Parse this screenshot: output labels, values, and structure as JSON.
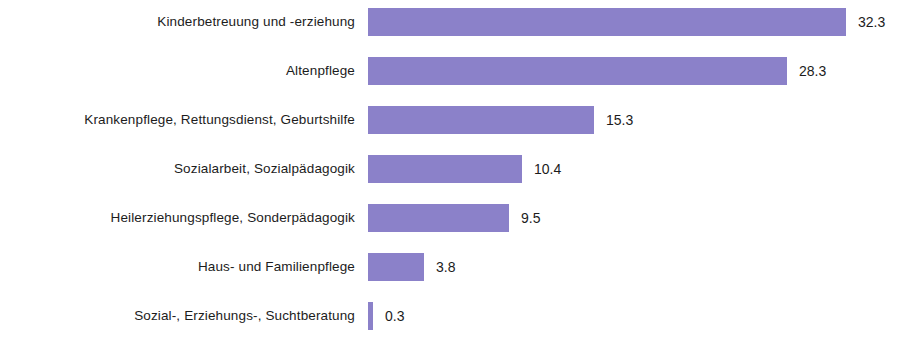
{
  "chart_data": {
    "type": "bar",
    "orientation": "horizontal",
    "title": "",
    "subtitle": "",
    "xlabel": "",
    "ylabel": "",
    "grid": false,
    "legend": null,
    "xlim": [
      0,
      35
    ],
    "axis_ticks": [],
    "bar_color": "#8b81c9",
    "background_color": "#ffffff",
    "text_color": "#1c1c1c",
    "value_label_format": "one-decimal",
    "categories": [
      "Kinderbetreuung und -erziehung",
      "Altenpflege",
      "Krankenpflege, Rettungsdienst, Geburtshilfe",
      "Sozialarbeit, Sozialpädagogik",
      "Heilerziehungspflege, Sonderpädagogik",
      "Haus- und Familienpflege",
      "Sozial-, Erziehungs-, Suchtberatung"
    ],
    "values": [
      32.3,
      28.3,
      15.3,
      10.4,
      9.5,
      3.8,
      0.3
    ],
    "value_labels": [
      "32.3",
      "28.3",
      "15.3",
      "10.4",
      "9.5",
      "3.8",
      "0.3"
    ]
  }
}
